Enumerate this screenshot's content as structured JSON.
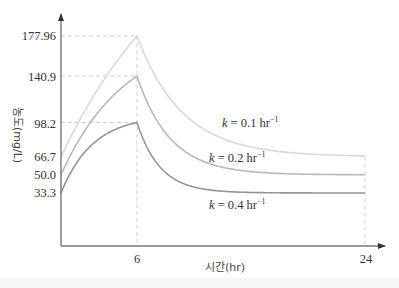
{
  "chart_data": {
    "type": "line",
    "title": "",
    "xlabel": "시간(hr)",
    "ylabel": "농도(mg/L)",
    "x_ticks": [
      6,
      24
    ],
    "y_ticks": [
      33.3,
      50.0,
      66.7,
      98.2,
      140.9,
      177.96
    ],
    "y_tick_labels": [
      "33.3",
      "50.0",
      "66.7",
      "98.2",
      "140.9",
      "177.96"
    ],
    "x_tick_labels": [
      "6",
      "24"
    ],
    "xlim": [
      0,
      26
    ],
    "ylim": [
      0,
      195
    ],
    "grid": false,
    "reference_lines": {
      "horizontal_dashed": [
        177.96,
        140.9,
        98.2
      ],
      "vertical_dashed": [
        6,
        24
      ]
    },
    "series": [
      {
        "name": "k = 0.1 hr⁻¹",
        "k": 0.1,
        "start": 66.7,
        "peak_time": 6,
        "peak": 177.96,
        "end_time": 24,
        "end": 66.7,
        "color": "#d9d9d9",
        "x": [
          0,
          6,
          24
        ],
        "values": [
          66.7,
          177.96,
          66.7
        ]
      },
      {
        "name": "k = 0.2 hr⁻¹",
        "k": 0.2,
        "start": 50.0,
        "peak_time": 6,
        "peak": 140.9,
        "end_time": 24,
        "end": 50.0,
        "color": "#b8b8b8",
        "x": [
          0,
          6,
          24
        ],
        "values": [
          50.0,
          140.9,
          50.0
        ]
      },
      {
        "name": "k = 0.4 hr⁻¹",
        "k": 0.4,
        "start": 33.3,
        "peak_time": 6,
        "peak": 98.2,
        "end_time": 24,
        "end": 33.3,
        "color": "#959595",
        "x": [
          0,
          6,
          24
        ],
        "values": [
          33.3,
          98.2,
          33.3
        ]
      }
    ]
  },
  "labels": {
    "series_0": {
      "k": "k",
      "eq": " = 0.1 hr",
      "sup": "−1"
    },
    "series_1": {
      "k": "k",
      "eq": " = 0.2 hr",
      "sup": "−1"
    },
    "series_2": {
      "k": "k",
      "eq": " = 0.4 hr",
      "sup": "−1"
    }
  }
}
